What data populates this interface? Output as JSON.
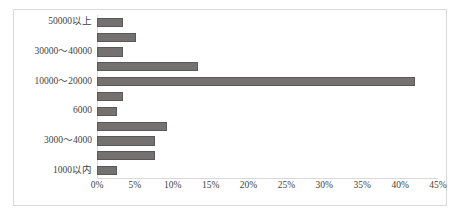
{
  "chart_data": {
    "type": "bar",
    "orientation": "horizontal",
    "title": "",
    "xlabel": "",
    "ylabel": "",
    "xlim": [
      0,
      45
    ],
    "xticks": [
      0,
      5,
      10,
      15,
      20,
      25,
      30,
      35,
      40,
      45
    ],
    "xtick_labels": [
      "0%",
      "5%",
      "10%",
      "15%",
      "20%",
      "25%",
      "30%",
      "35%",
      "40%",
      "45%"
    ],
    "grid": false,
    "legend": false,
    "value_unit": "%",
    "categories": [
      "50000以上",
      "",
      "30000～40000",
      "",
      "10000～20000",
      "",
      "6000",
      "",
      "3000～4000",
      "",
      "1000以内"
    ],
    "values": [
      3.4,
      5.2,
      3.4,
      13.3,
      42.0,
      3.4,
      2.6,
      9.3,
      7.6,
      7.6,
      2.7
    ],
    "bar_color": "#767171",
    "bar_border_color": "#595959",
    "axis_color": "#d9d9d9",
    "frame_color": "#d9d9d9",
    "text_color": "#3f3f3f"
  }
}
